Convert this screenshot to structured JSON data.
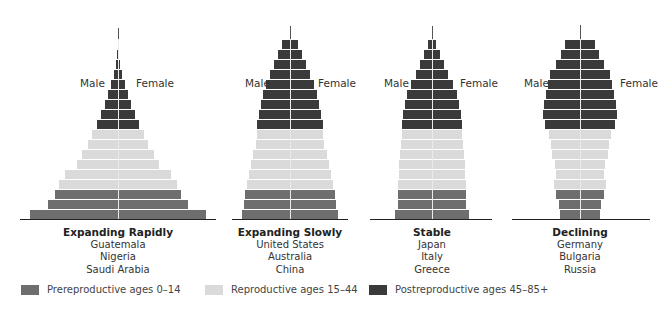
{
  "colors": {
    "prereproductive": "#6e6e6e",
    "reproductive": "#dadada",
    "postreproductive": "#3a3a3a"
  },
  "sex_labels": {
    "male": "Male",
    "female": "Female"
  },
  "legend": [
    {
      "key": "prereproductive",
      "label": "Prereproductive ages 0–14"
    },
    {
      "key": "reproductive",
      "label": "Reproductive ages 15–44"
    },
    {
      "key": "postreproductive",
      "label": "Postreproductive ages 45–85+"
    }
  ],
  "pyramids": [
    {
      "title": "Expanding Rapidly",
      "countries": [
        "Guatemala",
        "Nigeria",
        "Saudi Arabia"
      ],
      "center_x": 118,
      "male_label_x": 80,
      "female_label_x": 136,
      "label_y": 77,
      "stem_top": 28,
      "baseline": [
        20,
        216
      ],
      "half_widths": [
        88,
        70,
        63,
        59,
        53,
        41,
        36,
        30,
        26,
        21,
        17,
        13,
        10,
        7,
        4,
        2,
        1,
        0.5
      ]
    },
    {
      "title": "Expanding Slowly",
      "countries": [
        "United States",
        "Australia",
        "China"
      ],
      "center_x": 290,
      "male_label_x": 245,
      "female_label_x": 318,
      "label_y": 77,
      "stem_top": 26,
      "baseline": [
        232,
        348
      ],
      "half_widths": [
        48,
        46,
        45,
        43,
        41,
        39,
        37,
        34,
        33,
        33,
        31,
        29,
        27,
        24,
        20,
        16,
        12,
        8
      ]
    },
    {
      "title": "Stable",
      "countries": [
        "Japan",
        "Italy",
        "Greece"
      ],
      "center_x": 432,
      "male_label_x": 384,
      "female_label_x": 460,
      "label_y": 77,
      "stem_top": 26,
      "baseline": [
        370,
        492
      ],
      "half_widths": [
        37,
        34,
        34,
        34,
        33,
        33,
        32,
        31,
        30,
        30,
        29,
        27,
        25,
        21,
        16,
        12,
        8,
        4
      ]
    },
    {
      "title": "Declining",
      "countries": [
        "Germany",
        "Bulgaria",
        "Russia"
      ],
      "center_x": 580,
      "male_label_x": 524,
      "female_label_x": 620,
      "label_y": 77,
      "stem_top": 25,
      "baseline": [
        512,
        650
      ],
      "half_widths": [
        20,
        21,
        24,
        26,
        24,
        25,
        28,
        29,
        31,
        35,
        37,
        36,
        34,
        32,
        30,
        24,
        19,
        15
      ]
    }
  ],
  "age_groups": [
    "prereproductive",
    "prereproductive",
    "prereproductive",
    "reproductive",
    "reproductive",
    "reproductive",
    "reproductive",
    "reproductive",
    "reproductive",
    "postreproductive",
    "postreproductive",
    "postreproductive",
    "postreproductive",
    "postreproductive",
    "postreproductive",
    "postreproductive",
    "postreproductive",
    "postreproductive"
  ]
}
